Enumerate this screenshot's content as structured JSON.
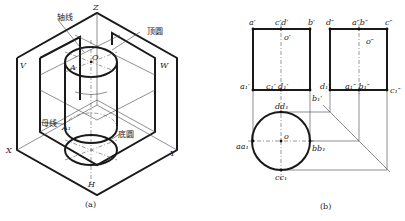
{
  "figure_a": {
    "caption": "(a)",
    "axes": {
      "z": "Z",
      "x": "X",
      "y": "Y"
    },
    "planes": {
      "v": "V",
      "w": "W",
      "h": "H"
    },
    "points": {
      "o": "O",
      "a": "A",
      "a1": "A₁"
    },
    "annotations": {
      "axis": "轴线",
      "top_circle": "顶圆",
      "generatrix": "母线",
      "bottom_circle": "底圆"
    }
  },
  "figure_b": {
    "caption": "(b)",
    "front_view": {
      "top_labels": {
        "a": "a′",
        "cd": "c′d′",
        "b": "b′"
      },
      "center": "o′",
      "bottom_labels": {
        "a1": "a₁′",
        "cd1": "c₁′ d₁′",
        "b1": "b₁′"
      }
    },
    "side_view": {
      "top_labels": {
        "d": "d″",
        "ab": "a″b″",
        "c": "c″"
      },
      "center": "o″",
      "bottom_labels": {
        "d1": "d₁″",
        "ab1": "a₁″ b₁″",
        "c1": "c₁″"
      }
    },
    "top_view": {
      "center": "o",
      "labels": {
        "dd1": "dd₁",
        "aa1": "aa₁",
        "bb1": "bb₁",
        "cc1": "cc₁"
      }
    }
  }
}
